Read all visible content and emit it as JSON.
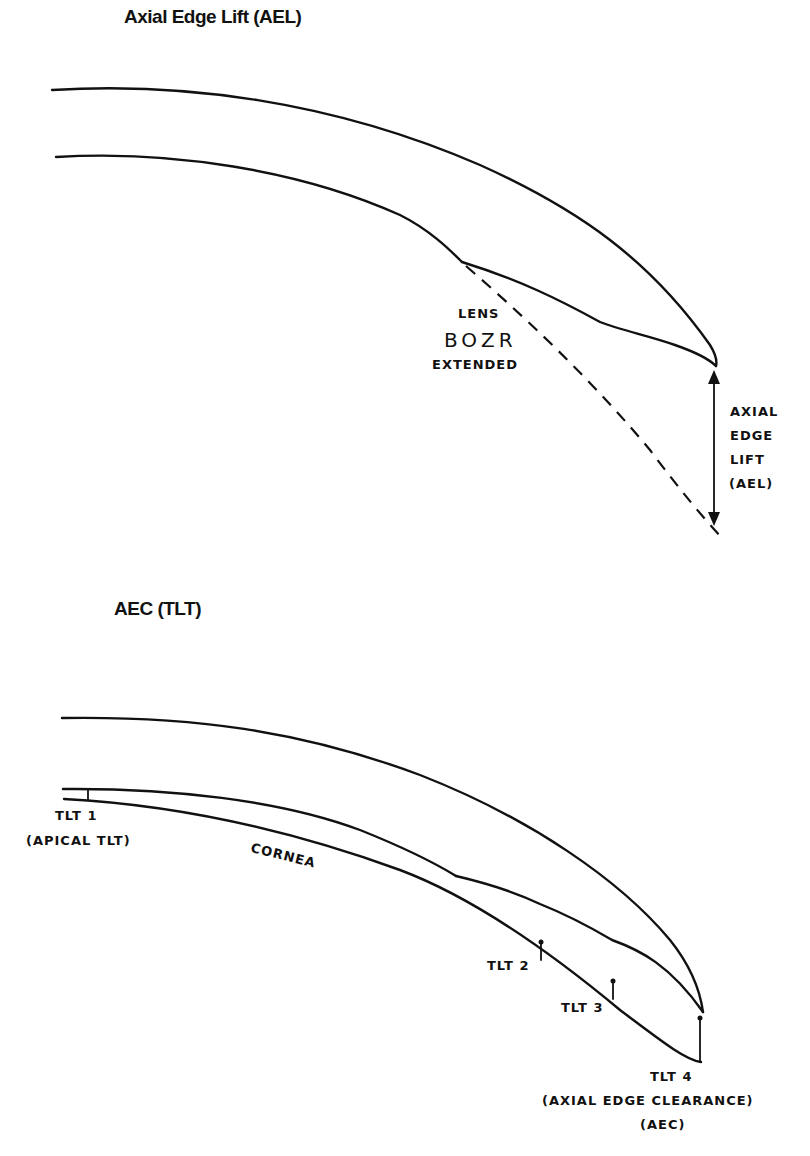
{
  "figure_top": {
    "title": "Axial Edge Lift (AEL)",
    "labels": {
      "lens": "LENS",
      "bozr": "BOZR",
      "extended": "EXTENDED",
      "ael_lines": [
        "AXIAL",
        "EDGE",
        "LIFT",
        "(AEL)"
      ]
    }
  },
  "figure_bottom": {
    "title": "AEC (TLT)",
    "labels": {
      "tlt1": "TLT 1",
      "apical": "(APICAL TLT)",
      "cornea": "CORNEA",
      "tlt2": "TLT 2",
      "tlt3": "TLT 3",
      "tlt4": "TLT 4",
      "aec_full": "(AXIAL EDGE CLEARANCE)",
      "aec": "(AEC)"
    }
  }
}
